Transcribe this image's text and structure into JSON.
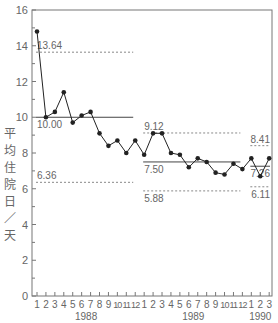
{
  "chart_data": {
    "type": "line",
    "title": "",
    "ylabel": "平均住院日／天",
    "xlabel": "",
    "ylim": [
      0,
      16
    ],
    "yticks": [
      0,
      2,
      4,
      6,
      8,
      10,
      12,
      14,
      16
    ],
    "grid": false,
    "legend": null,
    "x": [
      "1",
      "2",
      "3",
      "4",
      "5",
      "6",
      "7",
      "8",
      "9",
      "10",
      "11",
      "12",
      "1",
      "2",
      "3",
      "4",
      "5",
      "6",
      "7",
      "8",
      "9",
      "10",
      "11",
      "12",
      "1",
      "2",
      "3"
    ],
    "year_groups": [
      {
        "label": "1988",
        "start": 0,
        "end": 11
      },
      {
        "label": "1989",
        "start": 12,
        "end": 23
      },
      {
        "label": "1990",
        "start": 24,
        "end": 26
      }
    ],
    "series": [
      {
        "name": "平均住院日",
        "values": [
          14.8,
          10.0,
          10.3,
          11.4,
          9.7,
          10.1,
          10.3,
          9.1,
          8.4,
          8.7,
          8.0,
          8.7,
          7.9,
          9.1,
          9.1,
          8.0,
          7.9,
          7.2,
          7.7,
          7.5,
          6.9,
          6.8,
          7.4,
          7.1,
          7.7,
          6.7,
          7.7
        ]
      }
    ],
    "control_limits": [
      {
        "period": "1988",
        "start": 0,
        "end": 11,
        "ucl": 13.64,
        "mean": 10.0,
        "lcl": 6.36,
        "ucl_label": "13.64",
        "mean_label": "10.00",
        "lcl_label": "6.36"
      },
      {
        "period": "1989",
        "start": 12,
        "end": 23,
        "ucl": 9.12,
        "mean": 7.5,
        "lcl": 5.88,
        "ucl_label": "9.12",
        "mean_label": "7.50",
        "lcl_label": "5.88"
      },
      {
        "period": "1990",
        "start": 24,
        "end": 26,
        "ucl": 8.41,
        "mean": 7.26,
        "lcl": 6.11,
        "ucl_label": "8.41",
        "mean_label": "7.26",
        "lcl_label": "6.11"
      }
    ],
    "colors": {
      "line": "#222222",
      "axis": "#777777",
      "limits": "#888888",
      "text": "#666666"
    }
  }
}
